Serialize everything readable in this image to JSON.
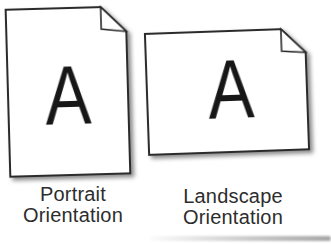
{
  "figure": {
    "type": "page-orientation-diagram",
    "colors": {
      "background": "#ffffff",
      "page_fill": "#ffffff",
      "page_border": "#2b2b2b",
      "drop_shadow": "#8f8f8f",
      "letter": "#171717",
      "label_text": "#2d2d2d"
    },
    "icons": {
      "portrait_page": "portrait-page-folded-corner-icon",
      "landscape_page": "landscape-page-folded-corner-icon"
    },
    "portrait": {
      "letter": "A",
      "label_line1": "Portrait",
      "label_line2": "Orientation"
    },
    "landscape": {
      "letter": "A",
      "label_line1": "Landscape",
      "label_line2": "Orientation"
    }
  }
}
